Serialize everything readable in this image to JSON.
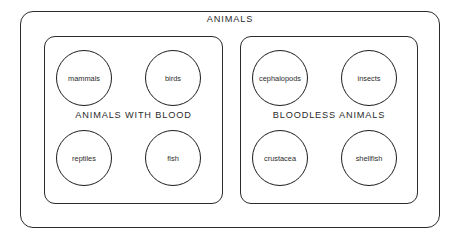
{
  "diagram": {
    "type": "nested-set-diagram",
    "universe": {
      "label": "ANIMALS"
    },
    "groups": [
      {
        "id": "animals-with-blood",
        "label": "ANIMALS WITH BLOOD",
        "members": [
          {
            "id": "mammals",
            "label": "mammals"
          },
          {
            "id": "birds",
            "label": "birds"
          },
          {
            "id": "reptiles",
            "label": "reptiles"
          },
          {
            "id": "fish",
            "label": "fish"
          }
        ]
      },
      {
        "id": "bloodless-animals",
        "label": "BLOODLESS ANIMALS",
        "members": [
          {
            "id": "cephalopods",
            "label": "cephalopods"
          },
          {
            "id": "insects",
            "label": "insects"
          },
          {
            "id": "crustacea",
            "label": "crustacea"
          },
          {
            "id": "shellfish",
            "label": "shellfish"
          }
        ]
      }
    ],
    "colors": {
      "stroke": "#2b2b2b",
      "circle_stroke": "#1c1c1c",
      "background": "#ffffff",
      "text": "#2b2b2b"
    }
  }
}
